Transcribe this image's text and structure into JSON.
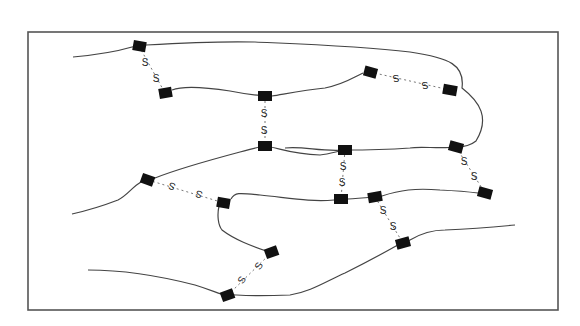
{
  "figure": {
    "type": "network diagram",
    "link_label": "S",
    "colors": {
      "frame": "#555555",
      "curve": "#444444",
      "node": "#111111",
      "link": "#777777",
      "label": "#222222"
    }
  },
  "nodes": [
    {
      "id": "n1",
      "x": 139,
      "y": 46
    },
    {
      "id": "n2",
      "x": 165,
      "y": 93
    },
    {
      "id": "n3",
      "x": 265,
      "y": 96
    },
    {
      "id": "n4",
      "x": 265,
      "y": 146
    },
    {
      "id": "n5",
      "x": 370,
      "y": 72
    },
    {
      "id": "n6",
      "x": 450,
      "y": 90
    },
    {
      "id": "n7",
      "x": 345,
      "y": 150
    },
    {
      "id": "n8",
      "x": 456,
      "y": 147
    },
    {
      "id": "n9",
      "x": 148,
      "y": 180
    },
    {
      "id": "n10",
      "x": 224,
      "y": 203
    },
    {
      "id": "n11",
      "x": 341,
      "y": 199
    },
    {
      "id": "n12",
      "x": 375,
      "y": 197
    },
    {
      "id": "n13",
      "x": 485,
      "y": 193
    },
    {
      "id": "n14",
      "x": 272,
      "y": 252
    },
    {
      "id": "n15",
      "x": 228,
      "y": 295
    },
    {
      "id": "n16",
      "x": 403,
      "y": 243
    }
  ],
  "links": [
    {
      "from": "n1",
      "to": "n2",
      "labels": [
        "S",
        "S"
      ]
    },
    {
      "from": "n3",
      "to": "n4",
      "labels": [
        "S",
        "S"
      ]
    },
    {
      "from": "n5",
      "to": "n6",
      "labels": [
        "S",
        "S"
      ]
    },
    {
      "from": "n7",
      "to": "n11",
      "labels": [
        "S",
        "S"
      ]
    },
    {
      "from": "n8",
      "to": "n13",
      "labels": [
        "S",
        "S"
      ]
    },
    {
      "from": "n9",
      "to": "n10",
      "labels": [
        "S",
        "S"
      ]
    },
    {
      "from": "n12",
      "to": "n16",
      "labels": [
        "S",
        "S"
      ]
    },
    {
      "from": "n14",
      "to": "n15",
      "labels": [
        "S",
        "S"
      ]
    }
  ]
}
